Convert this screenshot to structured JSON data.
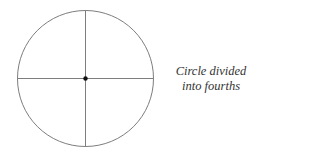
{
  "figure": {
    "caption_lines": [
      "Circle divided",
      "into fourths"
    ],
    "circle": {
      "cx": 85.5,
      "cy": 78.5,
      "r": 68
    },
    "divisions": 4,
    "stroke_color": "#6e6e6e",
    "center_dot_color": "#111111"
  }
}
